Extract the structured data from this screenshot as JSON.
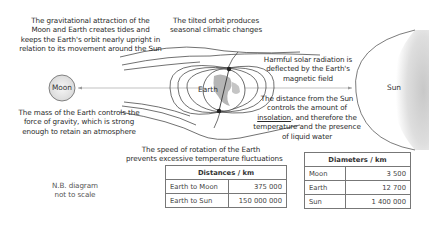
{
  "diagram": {
    "bodies": {
      "moon": "Moon",
      "earth": "Earth",
      "sun": "Sun"
    },
    "annotations": {
      "gravitational": [
        "The gravitational attraction of the",
        "Moon and Earth creates tides and",
        "keeps the Earth's orbit nearly upright in",
        "relation to its movement around the Sun"
      ],
      "tilted_orbit": [
        "The tilted orbit produces",
        "seasonal climatic changes"
      ],
      "solar_radiation": [
        "Harmful solar radiation is",
        "deflected by the Earth's",
        "magnetic field"
      ],
      "distance_sun": {
        "line1": "The distance from the Sun",
        "line2": "controls the amount of",
        "line3_link": "insolation",
        "line3_rest": ", and therefore the",
        "line4": "temperature and the presence",
        "line5": "of liquid water"
      },
      "mass": [
        "The mass of the Earth controls the",
        "force of gravity, which is strong",
        "enough to retain an atmosphere"
      ],
      "rotation": [
        "The speed of rotation of the Earth",
        "prevents excessive temperature fluctuations"
      ],
      "scale_note": [
        "N.B. diagram",
        "not to scale"
      ]
    },
    "colors": {
      "line": "#333333",
      "sun_fill": "#d9d9d9",
      "earth_land": "#b5b5b5",
      "moon_fill": "#eeeeee",
      "table_border": "#777777"
    }
  },
  "distances_table": {
    "header": "Distances / km",
    "rows": [
      {
        "label": "Earth to Moon",
        "value": "375 000"
      },
      {
        "label": "Earth to Sun",
        "value": "150 000 000"
      }
    ]
  },
  "diameters_table": {
    "header": "Diameters / km",
    "rows": [
      {
        "label": "Moon",
        "value": "3 500"
      },
      {
        "label": "Earth",
        "value": "12 700"
      },
      {
        "label": "Sun",
        "value": "1 400 000"
      }
    ]
  }
}
